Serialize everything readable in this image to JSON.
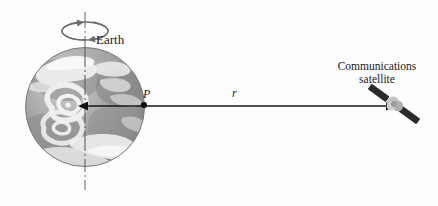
{
  "figure": {
    "background_color": "#fdfdfd"
  },
  "labels": {
    "earth": "Earth",
    "point_p": "P",
    "radius": "r",
    "satellite_line1": "Communications",
    "satellite_line2": "satellite"
  },
  "diagram": {
    "earth": {
      "center_x": 85,
      "center_y": 107,
      "radius": 60,
      "ocean_color": "#9a9a9a",
      "land_color": "#8d8d8d",
      "cloud_color": "#f2f2f2",
      "outline_color": "#7b7b7b"
    },
    "rotation_axis": {
      "x": 85,
      "y_top": 12,
      "y_bottom": 190,
      "style": "dash-dot",
      "color": "#6f6f6f"
    },
    "spin_arrow": {
      "center_x": 85,
      "center_y": 31,
      "rx": 23,
      "ry": 9,
      "color": "#6b6b6b",
      "direction": "counterclockwise-viewed-from-above"
    },
    "radius_arrow": {
      "x_start": 85,
      "x_end": 388,
      "y": 106,
      "color": "#1a1a1a",
      "double_headed": true
    },
    "point_p": {
      "x": 144,
      "y": 105,
      "color": "#111111",
      "radius": 3
    },
    "satellite": {
      "body_x": 394,
      "body_y": 104,
      "body_color": "#b9b9b9",
      "panel_color": "#2b2b2b",
      "panel_angle_deg": 36
    }
  },
  "colors": {
    "ink": "#1b1b1b",
    "accent_dark": "#2b2b2b",
    "globe_gray": "#9a9a9a"
  }
}
